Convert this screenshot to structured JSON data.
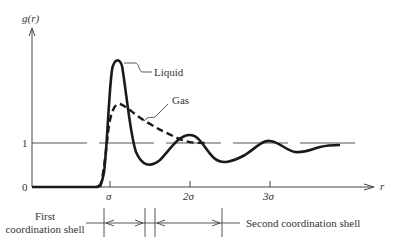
{
  "diagram": {
    "y_axis_label": "g(r)",
    "x_axis_label": "r",
    "y_ticks": [
      "0",
      "1"
    ],
    "x_ticks": [
      "σ",
      "2σ",
      "3σ"
    ],
    "curves": [
      {
        "name": "Liquid",
        "style": "solid"
      },
      {
        "name": "Gas",
        "style": "dashed"
      }
    ],
    "shells": {
      "first_line1": "First",
      "first_line2": "coordination shell",
      "second": "Second coordination shell"
    },
    "colors": {
      "ink": "#222222",
      "background": "#ffffff"
    }
  }
}
